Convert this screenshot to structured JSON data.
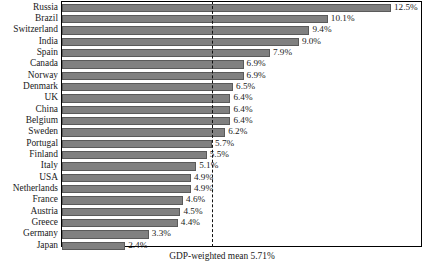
{
  "chart_data": {
    "type": "bar",
    "orientation": "horizontal",
    "title": "",
    "subtitle": "",
    "xlabel": "",
    "ylabel": "",
    "grid": false,
    "legend": null,
    "xlim": [
      0,
      13.0
    ],
    "categories": [
      "Russia",
      "Brazil",
      "Switzerland",
      "India",
      "Spain",
      "Canada",
      "Norway",
      "Denmark",
      "UK",
      "China",
      "Belgium",
      "Sweden",
      "Portugal",
      "Finland",
      "Italy",
      "USA",
      "Netherlands",
      "France",
      "Austria",
      "Greece",
      "Germany",
      "Japan"
    ],
    "values": [
      12.5,
      10.1,
      9.4,
      9.0,
      7.9,
      6.9,
      6.9,
      6.5,
      6.4,
      6.4,
      6.4,
      6.2,
      5.7,
      5.5,
      5.1,
      4.9,
      4.9,
      4.6,
      4.5,
      4.4,
      3.3,
      2.4
    ],
    "value_labels": [
      "12.5%",
      "10.1%",
      "9.4%",
      "9.0%",
      "7.9%",
      "6.9%",
      "6.9%",
      "6.5%",
      "6.4%",
      "6.4%",
      "6.4%",
      "6.2%",
      "5.7%",
      "5.5%",
      "5.1%",
      "4.9%",
      "4.9%",
      "4.6%",
      "4.5%",
      "4.4%",
      "3.3%",
      "2.4%"
    ],
    "annotations": [
      {
        "name": "gdp-weighted-mean",
        "text": "GDP-weighted mean 5.71%",
        "value": 5.71,
        "style": "dashed-vertical-line"
      }
    ],
    "colors": {
      "bar_fill": "#808080",
      "bar_edge": "#5a5a5a",
      "mean_line": "#111111",
      "text": "#1a1a1a",
      "background": "#ffffff"
    }
  }
}
